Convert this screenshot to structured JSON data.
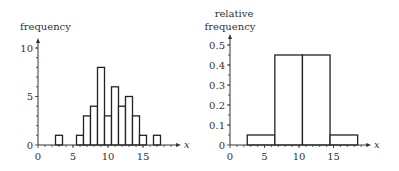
{
  "chart_data": [
    {
      "type": "bar",
      "title": "",
      "xlabel": "x",
      "ylabel": "frequency",
      "bin_width": 1,
      "categories": [
        3,
        4,
        5,
        6,
        7,
        8,
        9,
        10,
        11,
        12,
        13,
        14,
        15,
        16,
        17
      ],
      "values": [
        1,
        0,
        0,
        1,
        3,
        4,
        8,
        3,
        6,
        4,
        5,
        3,
        1,
        0,
        1
      ],
      "xlim": [
        0,
        19
      ],
      "ylim": [
        0,
        10
      ],
      "xticks": [
        "0",
        "5",
        "10",
        "15"
      ],
      "yticks": [
        "0",
        "5",
        "10"
      ],
      "grid": false
    },
    {
      "type": "bar",
      "title": "",
      "xlabel": "x",
      "ylabel": "relative frequency",
      "bins": [
        [
          2.5,
          6.5
        ],
        [
          6.5,
          10.5
        ],
        [
          10.5,
          14.5
        ],
        [
          14.5,
          18.5
        ]
      ],
      "values": [
        0.05,
        0.45,
        0.45,
        0.05
      ],
      "xlim": [
        0,
        19
      ],
      "ylim": [
        0,
        0.5
      ],
      "xticks": [
        "0",
        "5",
        "10",
        "15"
      ],
      "yticks": [
        "0",
        "0.1",
        "0.2",
        "0.3",
        "0.4",
        "0.5"
      ],
      "grid": false
    }
  ],
  "left": {
    "ylabel": "frequency",
    "xlabel": "x",
    "xticks": [
      {
        "v": 0,
        "t": "0"
      },
      {
        "v": 5,
        "t": "5"
      },
      {
        "v": 10,
        "t": "10"
      },
      {
        "v": 15,
        "t": "15"
      }
    ],
    "yticks": [
      {
        "v": 0,
        "t": "0"
      },
      {
        "v": 5,
        "t": "5"
      },
      {
        "v": 10,
        "t": "10"
      }
    ]
  },
  "right": {
    "ylabel_line1": "relative",
    "ylabel_line2": "frequency",
    "xlabel": "x",
    "xticks": [
      {
        "v": 0,
        "t": "0"
      },
      {
        "v": 5,
        "t": "5"
      },
      {
        "v": 10,
        "t": "10"
      },
      {
        "v": 15,
        "t": "15"
      }
    ],
    "yticks": [
      {
        "v": 0,
        "t": "0"
      },
      {
        "v": 0.1,
        "t": "0.1"
      },
      {
        "v": 0.2,
        "t": "0.2"
      },
      {
        "v": 0.3,
        "t": "0.3"
      },
      {
        "v": 0.4,
        "t": "0.4"
      },
      {
        "v": 0.5,
        "t": "0.5"
      }
    ]
  }
}
